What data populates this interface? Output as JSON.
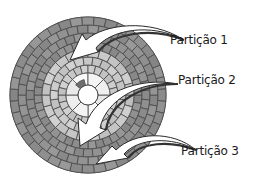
{
  "diagram": {
    "disk": {
      "center": [
        88,
        95
      ],
      "outer_radius": 78,
      "hole_radius": 10,
      "zones": [
        {
          "name": "hub",
          "r_inner": 10,
          "r_outer": 22,
          "color": "#f2f2f2",
          "rings": 1,
          "sectors": 8
        },
        {
          "name": "inner",
          "r_inner": 22,
          "r_outer": 46,
          "color": "#c8c8c8",
          "rings": 3,
          "sectors": 24
        },
        {
          "name": "outer",
          "r_inner": 46,
          "r_outer": 78,
          "color": "#8f8f8f",
          "rings": 4,
          "sectors": 40
        }
      ],
      "line_color": "#4a4a4a"
    },
    "labels": [
      {
        "text": "Partição 1",
        "x": 170,
        "y": 40
      },
      {
        "text": "Partição 2",
        "x": 178,
        "y": 80
      },
      {
        "text": "Partição 3",
        "x": 181,
        "y": 151
      }
    ],
    "arrows": [
      {
        "label": "Partição 1"
      },
      {
        "label": "Partição 2"
      },
      {
        "label": "Partição 3"
      }
    ]
  }
}
